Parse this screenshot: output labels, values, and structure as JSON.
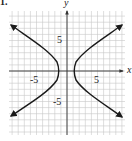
{
  "problem_number": "1.",
  "chart_data": {
    "type": "line",
    "title": "",
    "xlabel": "x",
    "ylabel": "y",
    "xlim": [
      -10,
      10
    ],
    "ylim": [
      -10,
      10
    ],
    "grid": true,
    "tick_labels": {
      "x": [
        "-5",
        "5"
      ],
      "y": [
        "5",
        "-5"
      ]
    },
    "series": [
      {
        "name": "hyperbola-right-branch",
        "description": "Right branch of horizontal hyperbola opening right, vertex near (1.2, 0), arrows at ends",
        "points": [
          [
            9,
            7.5
          ],
          [
            6,
            4.8
          ],
          [
            3.5,
            2.6
          ],
          [
            2,
            1.3
          ],
          [
            1.3,
            0.4
          ],
          [
            1.2,
            0
          ],
          [
            1.3,
            -0.4
          ],
          [
            2,
            -1.3
          ],
          [
            3.5,
            -2.6
          ],
          [
            6,
            -4.8
          ],
          [
            9,
            -7.5
          ]
        ]
      },
      {
        "name": "hyperbola-left-branch",
        "description": "Left branch of horizontal hyperbola opening left, vertex near (-1.2, 0), arrows at ends",
        "points": [
          [
            -9,
            7.5
          ],
          [
            -6,
            4.8
          ],
          [
            -3.5,
            2.6
          ],
          [
            -2,
            1.3
          ],
          [
            -1.3,
            0.4
          ],
          [
            -1.2,
            0
          ],
          [
            -1.3,
            -0.4
          ],
          [
            -2,
            -1.3
          ],
          [
            -3.5,
            -2.6
          ],
          [
            -6,
            -4.8
          ],
          [
            -9,
            -7.5
          ]
        ]
      }
    ],
    "colors": {
      "grid": "#c8c8c8",
      "axes": "#333333",
      "curve": "#1a1a1a"
    }
  }
}
